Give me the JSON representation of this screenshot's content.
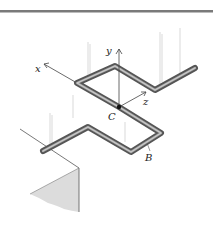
{
  "figure": {
    "labels": {
      "x_axis": "x",
      "y_axis": "y",
      "z_axis": "z",
      "center": "C",
      "point_b": "B"
    },
    "colors": {
      "rod_outer": "#555555",
      "rod_inner": "#a8a8a8",
      "axis": "#444444",
      "force_lines": "#c8c8c8",
      "wall_shade": "#dcdcdc",
      "top_rule": "#7a7a7a"
    }
  }
}
